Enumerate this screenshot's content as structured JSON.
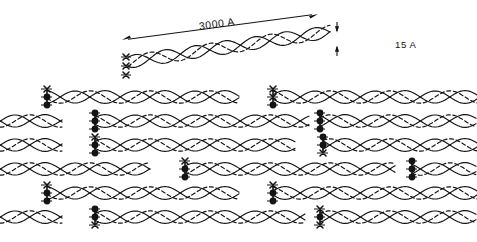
{
  "figure": {
    "annotations": {
      "molecule_length": "3000 A",
      "molecule_diameter": "15 A"
    },
    "colors": {
      "ink": "#141414",
      "background": "#ffffff"
    },
    "style": {
      "solid_chain_width": 1.15,
      "dashed_chain_width": 1.15,
      "dash_pattern": "4,2.6"
    },
    "single_molecule": {
      "label": "isolated tropocollagen triple helix",
      "x_start": 128,
      "x_end": 330,
      "y_center": 62,
      "tilt_deg": -8.5,
      "helix_period": 60,
      "amplitude": 6.5,
      "terminal_marks": [
        "x",
        "x",
        "x"
      ]
    },
    "dimension_arrows": {
      "length_arrow": {
        "x1": 122,
        "y1": 40,
        "x2": 318,
        "y2": 14,
        "heads": "both"
      },
      "diameter_arrow": {
        "x": 337,
        "y_top": 22,
        "y_bottom": 56,
        "heads": "both-outward"
      }
    },
    "lattice": {
      "rows": 6,
      "row_height": 24,
      "first_row_center": 97,
      "helix_period": 60,
      "amplitude": 6.2,
      "chains_per_fibril": 3,
      "fibril_segments": [
        {
          "row": 0,
          "x_start": 47,
          "x_end": 240
        },
        {
          "row": 0,
          "x_start": 273,
          "x_end": 477
        },
        {
          "row": 1,
          "x_start": 0,
          "x_end": 62
        },
        {
          "row": 1,
          "x_start": 95,
          "x_end": 310
        },
        {
          "row": 1,
          "x_start": 320,
          "x_end": 477
        },
        {
          "row": 2,
          "x_start": 0,
          "x_end": 62
        },
        {
          "row": 2,
          "x_start": 95,
          "x_end": 295
        },
        {
          "row": 2,
          "x_start": 323,
          "x_end": 477
        },
        {
          "row": 3,
          "x_start": 0,
          "x_end": 150
        },
        {
          "row": 3,
          "x_start": 185,
          "x_end": 395
        },
        {
          "row": 3,
          "x_start": 412,
          "x_end": 477
        },
        {
          "row": 4,
          "x_start": 47,
          "x_end": 240
        },
        {
          "row": 4,
          "x_start": 273,
          "x_end": 477
        },
        {
          "row": 5,
          "x_start": 0,
          "x_end": 62
        },
        {
          "row": 5,
          "x_start": 95,
          "x_end": 305
        },
        {
          "row": 5,
          "x_start": 320,
          "x_end": 477
        }
      ],
      "crosslink_clusters": [
        {
          "x": 47,
          "row": 0,
          "marks": [
            "x",
            "dot",
            "dot"
          ]
        },
        {
          "x": 273,
          "row": 0,
          "marks": [
            "x",
            "x",
            "dot"
          ]
        },
        {
          "x": 95,
          "row": 1,
          "marks": [
            "dot",
            "dot",
            "dot"
          ]
        },
        {
          "x": 320,
          "row": 1,
          "marks": [
            "dot",
            "dot",
            "dot"
          ]
        },
        {
          "x": 95,
          "row": 2,
          "marks": [
            "x",
            "dot",
            "dot"
          ]
        },
        {
          "x": 323,
          "row": 2,
          "marks": [
            "dot",
            "dot",
            "x"
          ]
        },
        {
          "x": 185,
          "row": 3,
          "marks": [
            "x",
            "dot",
            "dot"
          ]
        },
        {
          "x": 412,
          "row": 3,
          "marks": [
            "dot",
            "dot",
            "dot"
          ]
        },
        {
          "x": 47,
          "row": 4,
          "marks": [
            "x",
            "dot",
            "dot"
          ]
        },
        {
          "x": 273,
          "row": 4,
          "marks": [
            "x",
            "dot",
            "dot"
          ]
        },
        {
          "x": 95,
          "row": 5,
          "marks": [
            "dot",
            "dot",
            "x"
          ]
        },
        {
          "x": 320,
          "row": 5,
          "marks": [
            "x",
            "dot",
            "x"
          ]
        }
      ]
    }
  }
}
